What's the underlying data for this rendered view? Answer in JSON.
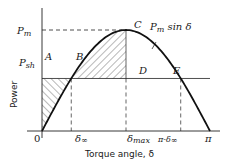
{
  "chart_data": {
    "type": "line",
    "title": "",
    "xlabel": "Torque angle, δ",
    "ylabel": "Power",
    "xlim": [
      0,
      3.14159
    ],
    "ylim": [
      0,
      1
    ],
    "grid": false,
    "series": [
      {
        "name": "Pm sin δ",
        "function": "sin",
        "amplitude_label": "Pm"
      }
    ],
    "levels": {
      "Pm": 1.0,
      "Psh": 0.52
    },
    "x_ticks": [
      {
        "label": "0",
        "value": 0
      },
      {
        "label": "δ∞",
        "value": 0.547
      },
      {
        "label": "δmax",
        "value": 1.5708
      },
      {
        "label": "π-δ∞",
        "value": 2.594
      },
      {
        "label": "π",
        "value": 3.14159
      }
    ],
    "y_ticks": [
      {
        "label": "Pm",
        "value": 1.0
      },
      {
        "label": "Psh",
        "value": 0.52
      }
    ],
    "points": [
      {
        "label": "A",
        "x": 0,
        "y": 0.52
      },
      {
        "label": "B",
        "x": 0.547,
        "y": 0.52
      },
      {
        "label": "C",
        "x": 1.5708,
        "y": 1.0
      },
      {
        "label": "D",
        "x": 1.5708,
        "y": 0.52
      },
      {
        "label": "E",
        "x": 2.594,
        "y": 0.52
      }
    ],
    "curve_label": "Pm sin δ",
    "shaded_regions": [
      {
        "name": "area-OAB",
        "from": 0,
        "to": 0.547,
        "between": "Psh and curve (below Psh)"
      },
      {
        "name": "area-BCD",
        "from": 0.547,
        "to": 1.5708,
        "between": "curve and Psh (above Psh)"
      }
    ]
  },
  "labels": {
    "origin": "0",
    "pm": "P",
    "pm_sub": "m",
    "psh": "P",
    "psh_sub": "sh",
    "ylabel": "Power",
    "xlabel": "Torque angle, δ",
    "A": "A",
    "B": "B",
    "C": "C",
    "D": "D",
    "E": "E",
    "curve_P": "P",
    "curve_sub": "m",
    "curve_rest": " sin δ",
    "tick_delta": "δ",
    "tick_inf": "∞",
    "tick_max": "max",
    "tick_pi_minus": "π-δ",
    "tick_pi": "π"
  }
}
